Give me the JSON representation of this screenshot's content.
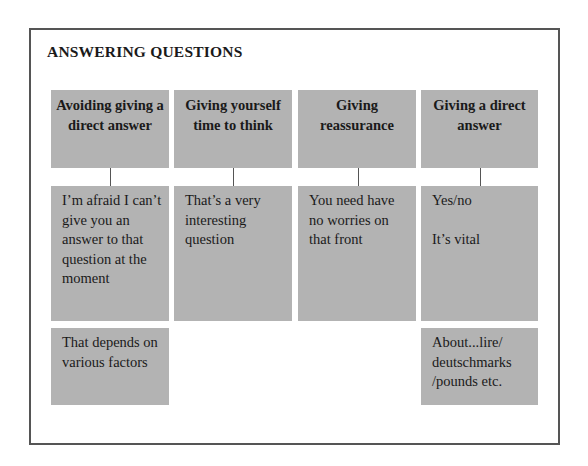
{
  "title": "ANSWERING QUESTIONS",
  "columns": [
    {
      "heading": "Avoiding giving a direct answer",
      "phrases": [
        "I’m afraid I can’t give you an answer to that question at the moment",
        "That depends on various factors"
      ]
    },
    {
      "heading": "Giving yourself time to think",
      "phrases": [
        "That’s a very interesting question"
      ]
    },
    {
      "heading": "Giving reassurance",
      "phrases": [
        "You need have no worries on that front"
      ]
    },
    {
      "heading": "Giving a direct answer",
      "phrases": [
        "Yes/no\n\nIt’s vital",
        "About...lire/ deutschmarks /pounds etc."
      ]
    }
  ],
  "colors": {
    "box_fill": "#b3b3b3",
    "frame_border": "#555555",
    "background": "#ffffff"
  }
}
